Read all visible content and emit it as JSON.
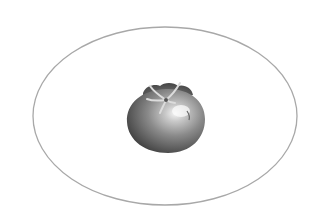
{
  "scene": {
    "description": "Grayscale illustration of a single tomato centered inside a thin gray elliptical outline on a white background",
    "background_color": "#ffffff",
    "ellipse": {
      "stroke_color": "#a8a8a8"
    },
    "tomato": {
      "shading": "grayscale",
      "highlight_color": "#f4f4f4",
      "shadow_color": "#3a3a3a"
    }
  }
}
